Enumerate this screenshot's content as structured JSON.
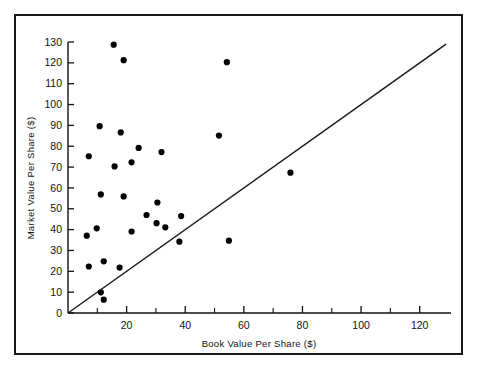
{
  "chart_data": {
    "type": "scatter",
    "title": "",
    "xlabel": "Book Value Per Share ($)",
    "ylabel": "Market Value Per Share ($)",
    "xlim": [
      0,
      130
    ],
    "ylim": [
      0,
      130
    ],
    "grid": false,
    "legend": null,
    "x_ticks_major": [
      0,
      20,
      40,
      60,
      80,
      100,
      120
    ],
    "x_ticks_minor": [
      10,
      30,
      50,
      70,
      90,
      110
    ],
    "x_tick_labels": [
      "0",
      "20",
      "40",
      "60",
      "80",
      "100",
      "120"
    ],
    "y_ticks_major": [
      0,
      10,
      20,
      30,
      40,
      50,
      60,
      70,
      80,
      90,
      100,
      110,
      120,
      130
    ],
    "y_tick_labels": [
      "0",
      "10",
      "20",
      "30",
      "40",
      "50",
      "60",
      "70",
      "80",
      "90",
      "100",
      "110",
      "120",
      "130"
    ],
    "reference_line": {
      "description": "identity line y = x",
      "from": [
        0,
        0
      ],
      "to": [
        129,
        129
      ]
    },
    "points": [
      {
        "x": 15.6,
        "y": 128.7
      },
      {
        "x": 19.0,
        "y": 121.3
      },
      {
        "x": 54.2,
        "y": 120.3
      },
      {
        "x": 10.8,
        "y": 89.6
      },
      {
        "x": 18.0,
        "y": 86.6
      },
      {
        "x": 51.5,
        "y": 85.1
      },
      {
        "x": 24.1,
        "y": 79.2
      },
      {
        "x": 31.9,
        "y": 77.2
      },
      {
        "x": 7.1,
        "y": 75.2
      },
      {
        "x": 21.7,
        "y": 72.3
      },
      {
        "x": 15.9,
        "y": 70.3
      },
      {
        "x": 75.9,
        "y": 67.3
      },
      {
        "x": 11.2,
        "y": 56.9
      },
      {
        "x": 19.0,
        "y": 55.9
      },
      {
        "x": 30.5,
        "y": 53.0
      },
      {
        "x": 26.8,
        "y": 47.0
      },
      {
        "x": 38.6,
        "y": 46.5
      },
      {
        "x": 30.2,
        "y": 43.1
      },
      {
        "x": 33.2,
        "y": 41.1
      },
      {
        "x": 9.8,
        "y": 40.6
      },
      {
        "x": 21.7,
        "y": 39.1
      },
      {
        "x": 6.4,
        "y": 37.1
      },
      {
        "x": 38.0,
        "y": 34.2
      },
      {
        "x": 54.9,
        "y": 34.7
      },
      {
        "x": 12.2,
        "y": 24.8
      },
      {
        "x": 7.1,
        "y": 22.3
      },
      {
        "x": 17.6,
        "y": 21.8
      },
      {
        "x": 11.2,
        "y": 9.9
      },
      {
        "x": 12.2,
        "y": 6.4
      }
    ]
  },
  "axes": {
    "x_title": "Book Value Per Share ($)",
    "y_title": "Market Value Per Share ($)"
  }
}
